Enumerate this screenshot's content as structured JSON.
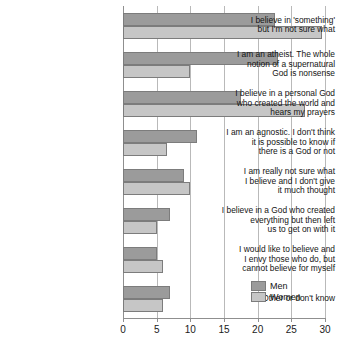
{
  "chart_data": {
    "type": "bar",
    "orientation": "horizontal",
    "title": "",
    "subtitle": "",
    "xlabel": "",
    "ylabel": "",
    "xlim": [
      0,
      30
    ],
    "xticks": [
      0,
      5,
      10,
      15,
      20,
      25,
      30
    ],
    "xtick_labels": [
      "0",
      "5",
      "10",
      "15",
      "20",
      "25",
      "30"
    ],
    "grid": true,
    "legend_position": "bottom-right",
    "categories": [
      "I believe in 'something' but I'm not sure what",
      "I am an atheist. The whole notion of a supernatural God is nonsense",
      "I believe in a personal God who created the world and hears my prayers",
      "I am an agnostic. I don't think it is possible to know if there is a God or not",
      "I am really not sure what I believe and I don't give it much thought",
      "I believe in a God who created everything but then left us to get on with it",
      "I would like to believe and I envy those who do, but cannot believe for myself",
      "Other or don't know"
    ],
    "category_lines": [
      [
        "I believe in 'something'",
        "but I'm not sure what"
      ],
      [
        "I am an atheist. The whole",
        "notion of a supernatural",
        "God is nonsense"
      ],
      [
        "I believe in a personal God",
        "who created the world and",
        "hears my prayers"
      ],
      [
        "I am an agnostic. I don't think",
        "it is possible to know if",
        "there is a God or not"
      ],
      [
        "I am really not sure what",
        "I believe and I don't give",
        "it much thought"
      ],
      [
        "I believe in a God who created",
        "everything but then left",
        "us to get on with it"
      ],
      [
        "I would like to believe and",
        "I envy those who do, but",
        "cannot believe for myself"
      ],
      [
        "Other or don't know"
      ]
    ],
    "series": [
      {
        "name": "Men",
        "color": "#9b9b9b",
        "values": [
          22.5,
          23,
          17.5,
          11,
          9,
          7,
          5,
          7
        ]
      },
      {
        "name": "Women",
        "color": "#c6c6c6",
        "values": [
          29.5,
          10,
          27,
          6.5,
          10,
          5,
          6,
          6
        ]
      }
    ]
  },
  "legend": {
    "items": [
      {
        "label": "Men",
        "color": "#9b9b9b"
      },
      {
        "label": "Women",
        "color": "#c6c6c6"
      }
    ]
  },
  "colors": {
    "men": "#9b9b9b",
    "women": "#c6c6c6",
    "grid": "#b9b9b9",
    "axis": "#8f8f8f",
    "bar_border": "#7c7c7c",
    "text": "#141414",
    "background": "#ffffff"
  }
}
